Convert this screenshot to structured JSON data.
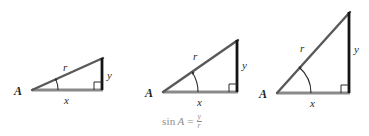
{
  "figure": {
    "background_color": "#ffffff",
    "width": 369,
    "height": 136
  },
  "style": {
    "base_color": "#8a8a8a",
    "hypotenuse_color": "#595959",
    "vertical_leg_color": "#141414",
    "arc_color": "#2b2b2b",
    "right_angle_color": "#2b2b2b",
    "label_color": "#2b2b2b",
    "formula_color": "#8d8d8d"
  },
  "triangles": [
    {
      "id": "triangle-shallow",
      "angle_label": "A",
      "hypotenuse_label": "r",
      "base_label": "x",
      "vertical_label": "y",
      "angle_degrees": 24,
      "vertex_a": [
        32,
        90
      ],
      "vertex_right": [
        103,
        90
      ],
      "vertex_top": [
        103,
        58
      ]
    },
    {
      "id": "triangle-medium",
      "angle_label": "A",
      "hypotenuse_label": "r",
      "base_label": "x",
      "vertical_label": "y",
      "angle_degrees": 35,
      "vertex_a": [
        163,
        92
      ],
      "vertex_right": [
        238,
        92
      ],
      "vertex_top": [
        238,
        40
      ]
    },
    {
      "id": "triangle-steep",
      "angle_label": "A",
      "hypotenuse_label": "r",
      "base_label": "x",
      "vertical_label": "y",
      "angle_degrees": 50,
      "vertex_a": [
        277,
        93
      ],
      "vertex_right": [
        350,
        93
      ],
      "vertex_top": [
        350,
        12
      ]
    }
  ],
  "formula": {
    "function_name": "sin",
    "argument": "A",
    "equals": "=",
    "numerator": "y",
    "denominator": "r",
    "full_text": "sin A = y/r"
  }
}
